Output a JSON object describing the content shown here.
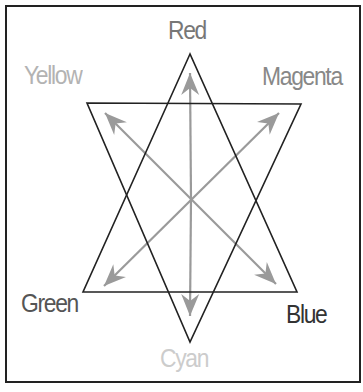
{
  "diagram": {
    "labels": {
      "red": {
        "text": "Red",
        "color": "#777777",
        "x": 168,
        "y": 17
      },
      "yellow": {
        "text": "Yellow",
        "color": "#b3b3b3",
        "x": 24,
        "y": 62
      },
      "magenta": {
        "text": "Magenta",
        "color": "#888888",
        "x": 262,
        "y": 63
      },
      "green": {
        "text": "Green",
        "color": "#555555",
        "x": 21,
        "y": 290
      },
      "blue": {
        "text": "Blue",
        "color": "#333333",
        "x": 286,
        "y": 301
      },
      "cyan": {
        "text": "Cyan",
        "color": "#cccccc",
        "x": 160,
        "y": 345
      }
    },
    "triangles": {
      "upward": [
        [
          190,
          54
        ],
        [
          83,
          292
        ],
        [
          297,
          292
        ]
      ],
      "downward": [
        [
          87,
          103
        ],
        [
          301,
          104
        ],
        [
          190,
          342
        ]
      ],
      "stroke": "#222222"
    },
    "center": [
      191,
      199
    ],
    "arrows": {
      "color": "#9a9a9a",
      "items": [
        {
          "name": "arrow-red",
          "from": [
            191,
            199
          ],
          "to": [
            190,
            73
          ],
          "both": false
        },
        {
          "name": "arrow-cyan",
          "from": [
            191,
            199
          ],
          "to": [
            190,
            316
          ],
          "both": false
        },
        {
          "name": "arrow-yellow-blue",
          "from": [
            105,
            113
          ],
          "to": [
            276,
            284
          ],
          "both": true
        },
        {
          "name": "arrow-magenta-green",
          "from": [
            279,
            113
          ],
          "to": [
            104,
            286
          ],
          "both": true
        }
      ]
    }
  }
}
